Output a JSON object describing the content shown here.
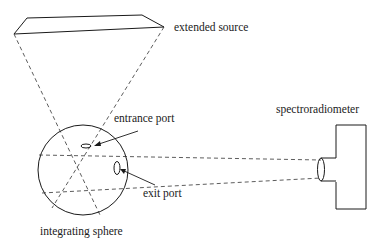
{
  "diagram": {
    "type": "optical-setup",
    "labels": {
      "extended_source": "extended source",
      "entrance_port": "entrance port",
      "exit_port": "exit port",
      "spectroradiometer": "spectroradiometer",
      "integrating_sphere": "integrating sphere"
    },
    "components": [
      {
        "id": "extended-source",
        "shape": "parallelogram"
      },
      {
        "id": "integrating-sphere",
        "shape": "circle"
      },
      {
        "id": "entrance-port",
        "shape": "small ellipse on sphere top"
      },
      {
        "id": "exit-port",
        "shape": "small ellipse on sphere right"
      },
      {
        "id": "spectroradiometer",
        "shape": "box with lens"
      }
    ],
    "connections": [
      {
        "from": "extended-source",
        "to": "integrating-sphere",
        "style": "dashed",
        "meaning": "light cone through entrance port"
      },
      {
        "from": "integrating-sphere",
        "to": "spectroradiometer",
        "style": "dashed",
        "meaning": "field of view through exit port"
      }
    ],
    "colors": {
      "stroke": "#1a1a1a",
      "background": "#ffffff"
    }
  }
}
